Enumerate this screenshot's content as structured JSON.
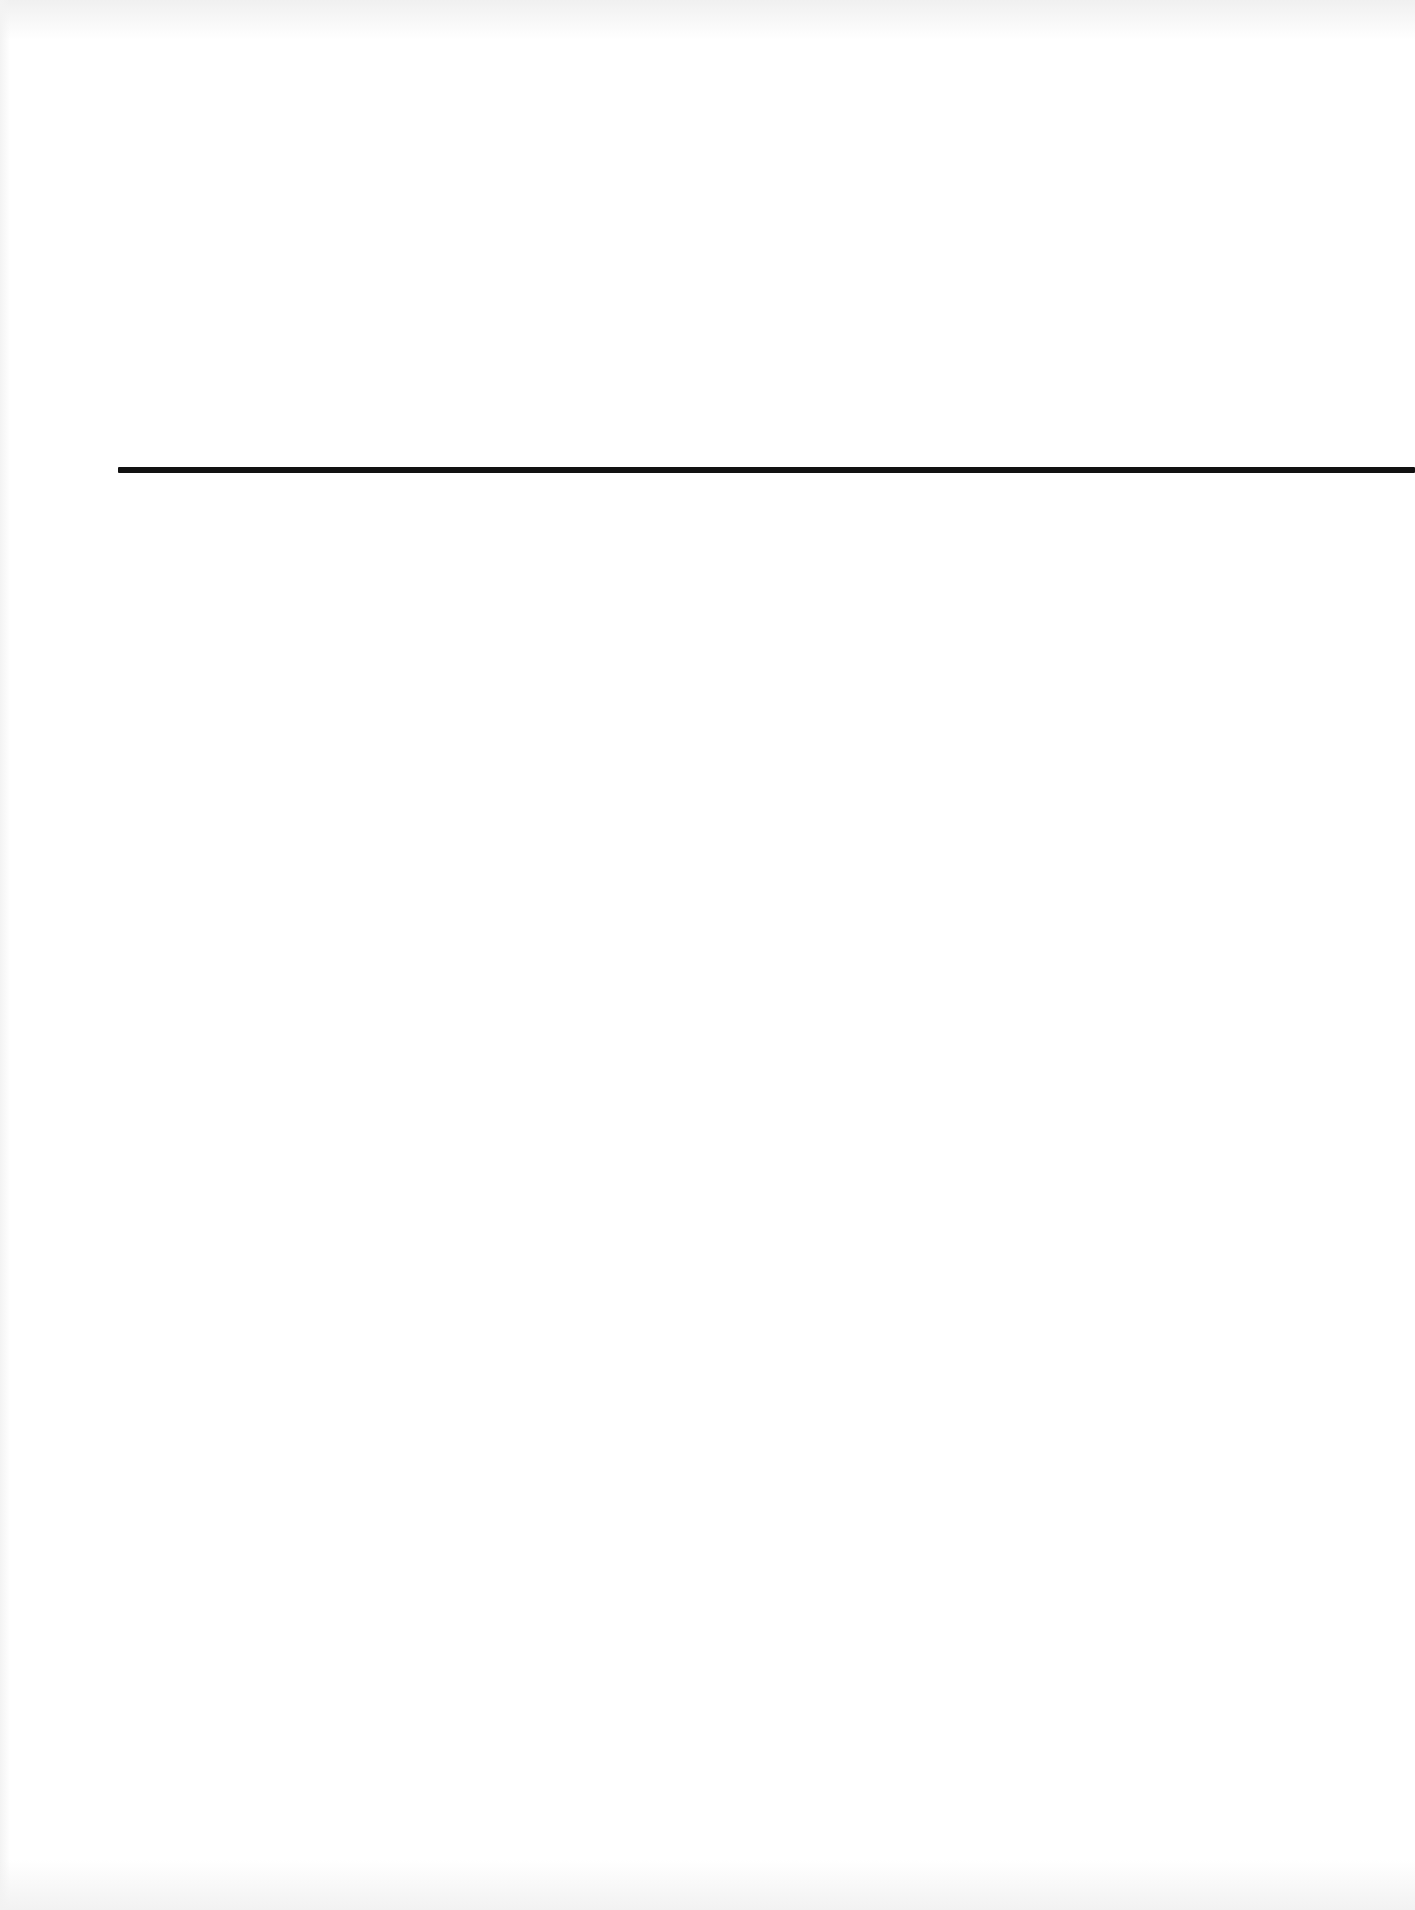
{
  "page": {
    "type": "blank scanned page",
    "background_color": "#ffffff",
    "text_content": []
  },
  "rule": {
    "orientation": "horizontal",
    "color": "#111111",
    "x_start": 118,
    "x_end": 1415,
    "y": 470,
    "thickness": 6
  }
}
